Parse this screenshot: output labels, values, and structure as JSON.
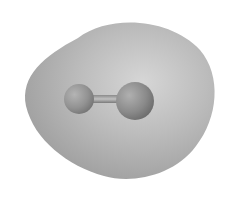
{
  "image": {
    "subject": "diatomic molecule with electron density isosurface",
    "colors": {
      "background": "#ffffff",
      "surface_light": "#d4d4d4",
      "surface_mid": "#b0b0b0",
      "surface_dark": "#8e8e8e",
      "atom_light": "#a8a8a8",
      "atom_dark": "#6e6e6e",
      "bond": "#9a9a9a"
    },
    "atoms": [
      {
        "cx": 79,
        "cy": 99,
        "r": 15
      },
      {
        "cx": 135,
        "cy": 101,
        "r": 19
      }
    ]
  }
}
